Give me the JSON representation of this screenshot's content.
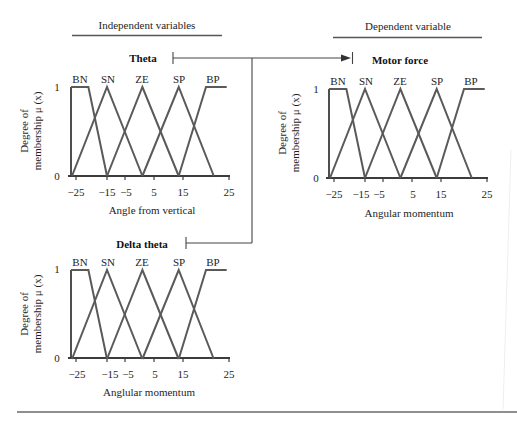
{
  "header": {
    "independent_label": "Independent variables",
    "dependent_label": "Dependent variable"
  },
  "plots": [
    {
      "id": "theta",
      "title": "Theta",
      "xlabel": "Angle from vertical",
      "ylabel_line1": "Degree of",
      "ylabel_line2": "membership μ (x)",
      "y_ticks": {
        "top": "1",
        "bottom": "0"
      },
      "x_ticks": [
        "−25",
        "−15",
        "−5",
        "5",
        "15",
        "25"
      ],
      "sets": [
        "BN",
        "SN",
        "ZE",
        "SP",
        "BP"
      ]
    },
    {
      "id": "motor-force",
      "title": "Motor force",
      "xlabel": "Angular momentum",
      "ylabel_line1": "Degree of",
      "ylabel_line2": "membership μ (x)",
      "y_ticks": {
        "top": "1",
        "bottom": "0"
      },
      "x_ticks": [
        "−25",
        "−15",
        "−5",
        "5",
        "15",
        "25"
      ],
      "sets": [
        "BN",
        "SN",
        "ZE",
        "SP",
        "BP"
      ]
    },
    {
      "id": "delta-theta",
      "title": "Delta theta",
      "xlabel": "Anglular momentum",
      "ylabel_line1": "Degree of",
      "ylabel_line2": "membership μ (x)",
      "y_ticks": {
        "top": "1",
        "bottom": "0"
      },
      "x_ticks": [
        "−25",
        "−15",
        "−5",
        "5",
        "15",
        "25"
      ],
      "sets": [
        "BN",
        "SN",
        "ZE",
        "SP",
        "BP"
      ]
    }
  ],
  "colors": {
    "curve": "#5a5a5a",
    "axis": "#3c3c3c",
    "text": "#1e1e1e"
  },
  "chart_data": [
    {
      "type": "line",
      "title": "Theta",
      "xlabel": "Angle from vertical",
      "ylabel": "Degree of membership μ (x)",
      "x_ticks": [
        -25,
        -15,
        -5,
        5,
        15,
        25
      ],
      "y_ticks": [
        0,
        1
      ],
      "xlim": [
        -27,
        25
      ],
      "ylim": [
        0,
        1
      ],
      "grid": false,
      "legend": "labels above curve peaks",
      "series": [
        {
          "name": "BN",
          "points": [
            [
              -27,
              1
            ],
            [
              -21,
              1
            ],
            [
              -15,
              0
            ]
          ]
        },
        {
          "name": "SN",
          "points": [
            [
              -26.6,
              0
            ],
            [
              -15,
              1
            ],
            [
              1,
              0
            ]
          ]
        },
        {
          "name": "ZE",
          "points": [
            [
              -15,
              0
            ],
            [
              1,
              1
            ],
            [
              13.5,
              0
            ]
          ]
        },
        {
          "name": "SP",
          "points": [
            [
              1,
              0
            ],
            [
              13.5,
              1
            ],
            [
              21.7,
              0
            ]
          ]
        },
        {
          "name": "BP",
          "points": [
            [
              13.5,
              0
            ],
            [
              20,
              1
            ],
            [
              24.5,
              1
            ]
          ]
        }
      ]
    },
    {
      "type": "line",
      "title": "Motor force",
      "xlabel": "Angular momentum",
      "ylabel": "Degree of membership μ (x)",
      "x_ticks": [
        -25,
        -15,
        -5,
        5,
        15,
        25
      ],
      "y_ticks": [
        0,
        1
      ],
      "xlim": [
        -27,
        25
      ],
      "ylim": [
        0,
        1
      ],
      "grid": false,
      "legend": "labels above curve peaks",
      "series": [
        {
          "name": "BN",
          "points": [
            [
              -27,
              1
            ],
            [
              -21,
              1
            ],
            [
              -15,
              0
            ]
          ]
        },
        {
          "name": "SN",
          "points": [
            [
              -26.6,
              0
            ],
            [
              -15,
              1
            ],
            [
              1,
              0
            ]
          ]
        },
        {
          "name": "ZE",
          "points": [
            [
              -15,
              0
            ],
            [
              1,
              1
            ],
            [
              13.5,
              0
            ]
          ]
        },
        {
          "name": "SP",
          "points": [
            [
              1,
              0
            ],
            [
              13.5,
              1
            ],
            [
              21.7,
              0
            ]
          ]
        },
        {
          "name": "BP",
          "points": [
            [
              13.5,
              0
            ],
            [
              20,
              1
            ],
            [
              24.5,
              1
            ]
          ]
        }
      ]
    },
    {
      "type": "line",
      "title": "Delta theta",
      "xlabel": "Anglular momentum",
      "ylabel": "Degree of membership μ (x)",
      "x_ticks": [
        -25,
        -15,
        -5,
        5,
        15,
        25
      ],
      "y_ticks": [
        0,
        1
      ],
      "xlim": [
        -27,
        25
      ],
      "ylim": [
        0,
        1
      ],
      "grid": false,
      "legend": "labels above curve peaks",
      "series": [
        {
          "name": "BN",
          "points": [
            [
              -27,
              1
            ],
            [
              -21,
              1
            ],
            [
              -15,
              0
            ]
          ]
        },
        {
          "name": "SN",
          "points": [
            [
              -26.6,
              0
            ],
            [
              -15,
              1
            ],
            [
              1,
              0
            ]
          ]
        },
        {
          "name": "ZE",
          "points": [
            [
              -15,
              0
            ],
            [
              1,
              1
            ],
            [
              13.5,
              0
            ]
          ]
        },
        {
          "name": "SP",
          "points": [
            [
              1,
              0
            ],
            [
              13.5,
              1
            ],
            [
              21.7,
              0
            ]
          ]
        },
        {
          "name": "BP",
          "points": [
            [
              13.5,
              0
            ],
            [
              20,
              1
            ],
            [
              24.5,
              1
            ]
          ]
        }
      ]
    }
  ]
}
